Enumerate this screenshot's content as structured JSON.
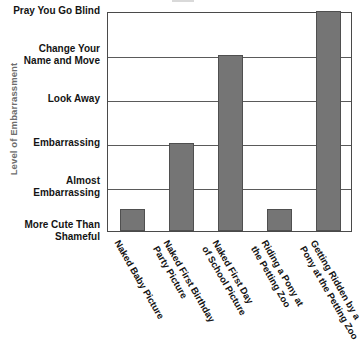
{
  "chart_data": {
    "type": "bar",
    "title": "",
    "xlabel": "",
    "ylabel": "Level of Embarrassment",
    "orientation": "vertical",
    "grid": true,
    "legend": false,
    "categories": [
      "Naked Baby Picture",
      "Naked First Birthday Party Picture",
      "Naked First Day of School Picture",
      "Riding a Pony at the Petting Zoo",
      "Getting Ridden by a Pony at the Petting Zoo"
    ],
    "category_lines": [
      "Naked Baby Picture",
      "Naked First Birthday\nParty Picture",
      "Naked First Day\nof School Picture",
      "Riding a Pony at\nthe Petting Zoo",
      "Getting Ridden by a\nPony at the Petting Zoo"
    ],
    "values": [
      0.5,
      2,
      4,
      0.5,
      5
    ],
    "value_labels": [
      "More Cute Than Shameful",
      "Embarrassing",
      "Change Your Name and Move",
      "More Cute Than Shameful",
      "Pray You Go Blind"
    ],
    "ylim": [
      0,
      5
    ],
    "ytick_values": [
      0,
      1,
      2,
      3,
      4,
      5
    ],
    "ytick_labels": [
      "More Cute Than\nShameful",
      "Almost\nEmbarrassing",
      "Embarrassing",
      "Look Away",
      "Change Your\nName and Move",
      "Pray You Go Blind"
    ],
    "bar_color": "#757575",
    "bar_edge_color": "#4f4f4f",
    "grid_color": "#5a5a5a",
    "axis_color": "#4a4a4a",
    "ylabel_color": "#6d6d6d"
  }
}
